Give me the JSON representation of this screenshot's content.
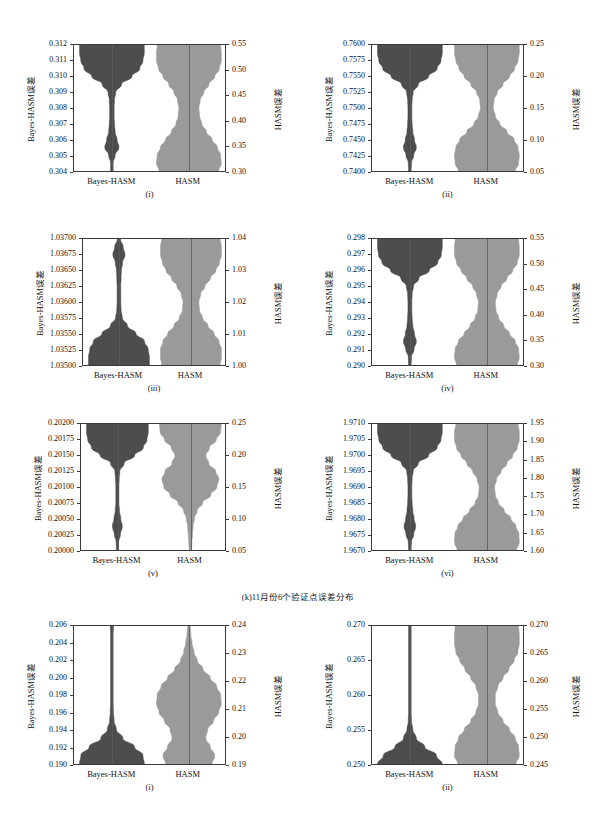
{
  "figure": {
    "background": "#ffffff",
    "colors": {
      "dark_violin": "#4d4d4d",
      "light_violin": "#9a9a9a",
      "axis": "#3a3a3a",
      "text": "#111111"
    },
    "axis_titles": {
      "left": "Bayes-HASM误差",
      "right": "HASM误差"
    },
    "categories": [
      "Bayes-HASM",
      "HASM"
    ],
    "group_caption": "(k)11月份6个验证点误差分布"
  },
  "chart_data": [
    {
      "type": "violin",
      "panel_label": "(i)",
      "ylabel_left": "Bayes-HASM误差",
      "ylabel_right": "HASM误差",
      "categories": [
        "Bayes-HASM",
        "HASM"
      ],
      "left_ticks": [
        "0.304",
        "0.305",
        "0.306",
        "0.307",
        "0.308",
        "0.309",
        "0.310",
        "0.311",
        "0.312"
      ],
      "right_ticks": [
        "0.30",
        "0.35",
        "0.40",
        "0.45",
        "0.50",
        "0.55"
      ],
      "ylim_left": [
        0.304,
        0.312
      ],
      "ylim_right": [
        0.3,
        0.55
      ],
      "series": [
        {
          "name": "Bayes-HASM",
          "color": "#4d4d4d",
          "axis": "left",
          "median": 0.3119,
          "min": 0.304,
          "max": 0.312,
          "density": [
            0.04,
            0.04,
            0.1,
            0.22,
            0.16,
            0.1,
            0.08,
            0.07,
            0.07,
            0.08,
            0.12,
            0.3,
            0.62,
            0.86,
            0.96,
            1.0,
            1.0
          ]
        },
        {
          "name": "HASM",
          "color": "#9a9a9a",
          "axis": "right",
          "median": 0.435,
          "min": 0.3,
          "max": 0.55,
          "density": [
            0.92,
            1.0,
            0.98,
            0.88,
            0.72,
            0.54,
            0.4,
            0.33,
            0.31,
            0.35,
            0.46,
            0.62,
            0.8,
            0.94,
            1.0,
            1.0,
            0.98
          ]
        }
      ]
    },
    {
      "type": "violin",
      "panel_label": "(ii)",
      "ylabel_left": "Bayes-HASM误差",
      "ylabel_right": "HASM误差",
      "categories": [
        "Bayes-HASM",
        "HASM"
      ],
      "left_ticks": [
        "0.7400",
        "0.7425",
        "0.7450",
        "0.7475",
        "0.7500",
        "0.7525",
        "0.7550",
        "0.7575",
        "0.7600"
      ],
      "right_ticks": [
        "0.05",
        "0.10",
        "0.15",
        "0.20",
        "0.25"
      ],
      "ylim_left": [
        0.74,
        0.76
      ],
      "ylim_right": [
        0.05,
        0.26
      ],
      "series": [
        {
          "name": "Bayes-HASM",
          "color": "#4d4d4d",
          "axis": "left",
          "median": 0.7598,
          "min": 0.74,
          "max": 0.76,
          "density": [
            0.04,
            0.05,
            0.12,
            0.2,
            0.14,
            0.09,
            0.07,
            0.06,
            0.06,
            0.07,
            0.1,
            0.26,
            0.58,
            0.84,
            0.96,
            1.0,
            1.0
          ]
        },
        {
          "name": "HASM",
          "color": "#9a9a9a",
          "axis": "right",
          "median": 0.165,
          "min": 0.05,
          "max": 0.26,
          "density": [
            0.88,
            0.98,
            1.0,
            0.96,
            0.84,
            0.62,
            0.4,
            0.26,
            0.2,
            0.22,
            0.32,
            0.5,
            0.7,
            0.86,
            0.96,
            1.0,
            1.0
          ]
        }
      ]
    },
    {
      "type": "violin",
      "panel_label": "(iii)",
      "ylabel_left": "Bayes-HASM误差",
      "ylabel_right": "HASM误差",
      "categories": [
        "Bayes-HASM",
        "HASM"
      ],
      "left_ticks": [
        "1.03500",
        "1.03525",
        "1.03550",
        "1.03575",
        "1.03600",
        "1.03625",
        "1.03650",
        "1.03675",
        "1.03700"
      ],
      "right_ticks": [
        "1.00",
        "1.01",
        "1.02",
        "1.03",
        "1.04"
      ],
      "ylim_left": [
        1.035,
        1.037
      ],
      "ylim_right": [
        0.9975,
        1.0405
      ],
      "series": [
        {
          "name": "Bayes-HASM",
          "color": "#4d4d4d",
          "axis": "left",
          "median": 1.03502,
          "min": 1.035,
          "max": 1.037,
          "density": [
            1.0,
            1.0,
            0.96,
            0.84,
            0.56,
            0.28,
            0.11,
            0.07,
            0.06,
            0.06,
            0.06,
            0.07,
            0.08,
            0.12,
            0.2,
            0.14,
            0.05
          ]
        },
        {
          "name": "HASM",
          "color": "#9a9a9a",
          "axis": "right",
          "median": 1.017,
          "min": 0.9975,
          "max": 1.0395,
          "density": [
            0.96,
            1.0,
            1.0,
            0.92,
            0.76,
            0.56,
            0.38,
            0.28,
            0.26,
            0.32,
            0.46,
            0.64,
            0.82,
            0.94,
            1.0,
            1.0,
            0.96
          ]
        }
      ]
    },
    {
      "type": "violin",
      "panel_label": "(iv)",
      "ylabel_left": "Bayes-HASM误差",
      "ylabel_right": "HASM误差",
      "categories": [
        "Bayes-HASM",
        "HASM"
      ],
      "left_ticks": [
        "0.290",
        "0.291",
        "0.292",
        "0.293",
        "0.294",
        "0.295",
        "0.296",
        "0.297",
        "0.298"
      ],
      "right_ticks": [
        "0.30",
        "0.35",
        "0.40",
        "0.45",
        "0.50",
        "0.55"
      ],
      "ylim_left": [
        0.29,
        0.298
      ],
      "ylim_right": [
        0.29,
        0.555
      ],
      "series": [
        {
          "name": "Bayes-HASM",
          "color": "#4d4d4d",
          "axis": "left",
          "median": 0.2979,
          "min": 0.29,
          "max": 0.298,
          "density": [
            0.04,
            0.05,
            0.13,
            0.2,
            0.14,
            0.09,
            0.07,
            0.06,
            0.06,
            0.07,
            0.11,
            0.28,
            0.6,
            0.86,
            0.97,
            1.0,
            1.0
          ]
        },
        {
          "name": "HASM",
          "color": "#9a9a9a",
          "axis": "right",
          "median": 0.425,
          "min": 0.29,
          "max": 0.555,
          "density": [
            0.94,
            1.0,
            0.98,
            0.88,
            0.7,
            0.52,
            0.36,
            0.28,
            0.26,
            0.32,
            0.44,
            0.62,
            0.8,
            0.94,
            1.0,
            1.0,
            0.98
          ]
        }
      ]
    },
    {
      "type": "violin",
      "panel_label": "(v)",
      "ylabel_left": "Bayes-HASM误差",
      "ylabel_right": "HASM误差",
      "categories": [
        "Bayes-HASM",
        "HASM"
      ],
      "left_ticks": [
        "0.20000",
        "0.20025",
        "0.20050",
        "0.20075",
        "0.20100",
        "0.20125",
        "0.20150",
        "0.20175",
        "0.20200"
      ],
      "right_ticks": [
        "0.05",
        "0.10",
        "0.15",
        "0.20",
        "0.25"
      ],
      "ylim_left": [
        0.2,
        0.202
      ],
      "ylim_right": [
        0.045,
        0.275
      ],
      "series": [
        {
          "name": "Bayes-HASM",
          "color": "#4d4d4d",
          "axis": "left",
          "median": 0.20198,
          "min": 0.2,
          "max": 0.202,
          "density": [
            0.03,
            0.04,
            0.1,
            0.16,
            0.11,
            0.07,
            0.05,
            0.05,
            0.05,
            0.06,
            0.08,
            0.22,
            0.56,
            0.84,
            0.96,
            1.0,
            1.0
          ]
        },
        {
          "name": "HASM",
          "color": "#9a9a9a",
          "axis": "right",
          "median": 0.205,
          "min": 0.045,
          "max": 0.275,
          "density": [
            0.04,
            0.05,
            0.07,
            0.09,
            0.13,
            0.22,
            0.4,
            0.66,
            0.86,
            0.92,
            0.82,
            0.6,
            0.5,
            0.62,
            0.84,
            0.98,
            1.0
          ]
        }
      ]
    },
    {
      "type": "violin",
      "panel_label": "(vi)",
      "ylabel_left": "Bayes-HASM误差",
      "ylabel_right": "HASM误差",
      "categories": [
        "Bayes-HASM",
        "HASM"
      ],
      "left_ticks": [
        "1.9670",
        "1.9675",
        "1.9680",
        "1.9685",
        "1.9690",
        "1.9695",
        "1.9700",
        "1.9705",
        "1.9710"
      ],
      "right_ticks": [
        "1.60",
        "1.65",
        "1.70",
        "1.75",
        "1.80",
        "1.85",
        "1.90",
        "1.95"
      ],
      "ylim_left": [
        1.967,
        1.971
      ],
      "ylim_right": [
        1.595,
        1.965
      ],
      "series": [
        {
          "name": "Bayes-HASM",
          "color": "#4d4d4d",
          "axis": "left",
          "median": 1.9709,
          "min": 1.967,
          "max": 1.971,
          "density": [
            0.04,
            0.05,
            0.12,
            0.18,
            0.13,
            0.09,
            0.07,
            0.06,
            0.06,
            0.07,
            0.1,
            0.26,
            0.58,
            0.84,
            0.96,
            1.0,
            1.0
          ]
        },
        {
          "name": "HASM",
          "color": "#9a9a9a",
          "axis": "right",
          "median": 1.78,
          "min": 1.595,
          "max": 1.965,
          "density": [
            0.92,
            1.0,
            0.99,
            0.9,
            0.74,
            0.54,
            0.36,
            0.26,
            0.24,
            0.3,
            0.44,
            0.62,
            0.8,
            0.94,
            1.0,
            1.0,
            0.96
          ]
        }
      ]
    },
    {
      "type": "violin",
      "panel_label": "(i)",
      "ylabel_left": "Bayes-HASM误差",
      "ylabel_right": "HASM误差",
      "categories": [
        "Bayes-HASM",
        "HASM"
      ],
      "left_ticks": [
        "0.190",
        "0.192",
        "0.194",
        "0.196",
        "0.198",
        "0.200",
        "0.202",
        "0.204",
        "0.206"
      ],
      "right_ticks": [
        "0.19",
        "0.20",
        "0.21",
        "0.22",
        "0.23",
        "0.24"
      ],
      "ylim_left": [
        0.1895,
        0.2062
      ],
      "ylim_right": [
        0.1888,
        0.2405
      ],
      "series": [
        {
          "name": "Bayes-HASM",
          "color": "#4d4d4d",
          "axis": "left",
          "median": 0.1902,
          "min": 0.19,
          "max": 0.206,
          "density": [
            1.0,
            0.96,
            0.7,
            0.34,
            0.14,
            0.07,
            0.05,
            0.04,
            0.04,
            0.04,
            0.04,
            0.04,
            0.04,
            0.04,
            0.04,
            0.04,
            0.05
          ]
        },
        {
          "name": "HASM",
          "color": "#9a9a9a",
          "axis": "right",
          "median": 0.2005,
          "min": 0.19,
          "max": 0.24,
          "density": [
            0.72,
            0.8,
            0.66,
            0.52,
            0.58,
            0.76,
            0.92,
            1.0,
            0.98,
            0.86,
            0.66,
            0.44,
            0.26,
            0.16,
            0.1,
            0.06,
            0.04
          ]
        }
      ]
    },
    {
      "type": "violin",
      "panel_label": "(ii)",
      "ylabel_left": "Bayes-HASM误差",
      "ylabel_right": "HASM误差",
      "categories": [
        "Bayes-HASM",
        "HASM"
      ],
      "left_ticks": [
        "0.250",
        "0.255",
        "0.260",
        "0.265",
        "0.270"
      ],
      "right_ticks": [
        "0.245",
        "0.250",
        "0.255",
        "0.260",
        "0.265",
        "0.270"
      ],
      "ylim_left": [
        0.2472,
        0.2702
      ],
      "ylim_right": [
        0.2432,
        0.2702
      ],
      "series": [
        {
          "name": "Bayes-HASM",
          "color": "#4d4d4d",
          "axis": "left",
          "median": 0.2476,
          "min": 0.2472,
          "max": 0.27,
          "density": [
            1.0,
            0.82,
            0.46,
            0.2,
            0.09,
            0.05,
            0.04,
            0.04,
            0.04,
            0.04,
            0.04,
            0.04,
            0.04,
            0.04,
            0.04,
            0.04,
            0.04
          ]
        },
        {
          "name": "HASM",
          "color": "#9a9a9a",
          "axis": "right",
          "median": 0.2578,
          "min": 0.2432,
          "max": 0.27,
          "density": [
            0.9,
            1.0,
            0.98,
            0.88,
            0.7,
            0.5,
            0.34,
            0.26,
            0.26,
            0.34,
            0.5,
            0.68,
            0.84,
            0.96,
            1.0,
            1.0,
            0.98
          ]
        }
      ]
    }
  ]
}
